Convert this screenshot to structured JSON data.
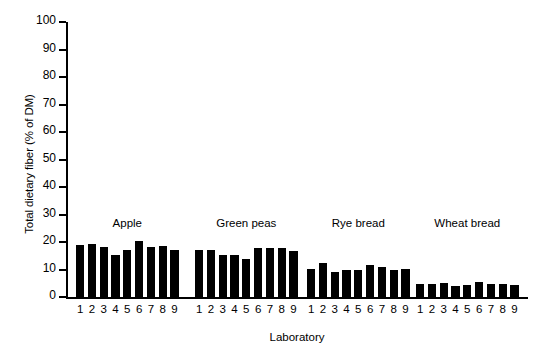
{
  "chart_data": {
    "type": "bar",
    "title": "",
    "subtitle": "",
    "xlabel": "Laboratory",
    "ylabel": "Total dietary fiber (% of DM)",
    "ylim": [
      0,
      100
    ],
    "yticks": [
      0,
      10,
      20,
      30,
      40,
      50,
      60,
      70,
      80,
      90,
      100
    ],
    "grid": false,
    "legend": "none",
    "bar_color": "#000000",
    "categories": [
      "1",
      "2",
      "3",
      "4",
      "5",
      "6",
      "7",
      "8",
      "9"
    ],
    "groups": [
      {
        "name": "Apple",
        "label": "Apple",
        "x": [
          "1",
          "2",
          "3",
          "4",
          "5",
          "6",
          "7",
          "8",
          "9"
        ],
        "values": [
          19.0,
          19.2,
          18.2,
          15.2,
          17.2,
          20.5,
          18.2,
          18.5,
          17.0
        ]
      },
      {
        "name": "Green peas",
        "label": "Green peas",
        "x": [
          "1",
          "2",
          "3",
          "4",
          "5",
          "6",
          "7",
          "8",
          "9"
        ],
        "values": [
          17.0,
          17.0,
          15.2,
          15.2,
          14.0,
          18.0,
          17.8,
          18.0,
          16.8
        ]
      },
      {
        "name": "Rye bread",
        "label": "Rye bread",
        "x": [
          "1",
          "2",
          "3",
          "4",
          "5",
          "6",
          "7",
          "8",
          "9"
        ],
        "values": [
          10.2,
          12.4,
          9.0,
          9.8,
          9.8,
          11.5,
          11.0,
          9.8,
          10.2
        ]
      },
      {
        "name": "Wheat bread",
        "label": "Wheat bread",
        "x": [
          "1",
          "2",
          "3",
          "4",
          "5",
          "6",
          "7",
          "8",
          "9"
        ],
        "values": [
          4.6,
          4.6,
          5.0,
          4.0,
          4.2,
          5.4,
          4.8,
          4.8,
          4.4
        ]
      }
    ]
  }
}
